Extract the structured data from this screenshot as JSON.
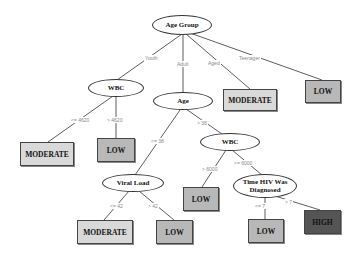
{
  "diagram": {
    "type": "decision-tree",
    "nodes": {
      "root": {
        "label": "Age Group"
      },
      "wbc_youth": {
        "label": "WBC"
      },
      "age_adult": {
        "label": "Age"
      },
      "leaf_aged": {
        "label": "MODERATE"
      },
      "leaf_teen": {
        "label": "LOW"
      },
      "leaf_wbc_le": {
        "label": "MODERATE"
      },
      "leaf_wbc_gt": {
        "label": "LOW"
      },
      "wbc_adult": {
        "label": "WBC"
      },
      "viral_load": {
        "label": "Viral Load"
      },
      "leaf_wbc2_gt": {
        "label": "LOW"
      },
      "time_hiv": {
        "label": "Time HIV Was Diagnosed"
      },
      "leaf_vl_le": {
        "label": "MODERATE"
      },
      "leaf_vl_gt": {
        "label": "LOW"
      },
      "leaf_time_le": {
        "label": "LOW"
      },
      "leaf_time_gt": {
        "label": "HIGH"
      }
    },
    "edges": {
      "youth": "Youth",
      "adult": "Adult",
      "aged": "Aged",
      "teenager": "Teenager",
      "wbc_le": "<= 4620",
      "wbc_gt": "> 4620",
      "age_le": "<= 38",
      "age_gt": "> 38",
      "wbc2_gt": "> 6000",
      "wbc2_le": "<= 6000",
      "vl_le": "<= 42",
      "vl_gt": "> 42",
      "time_le": "<= 7",
      "time_gt": "> 7"
    },
    "colors": {
      "moderate": "#d9d9d9",
      "low": "#b8b8b8",
      "high": "#555555",
      "edge": "#333333",
      "edge_label": "#888888"
    }
  }
}
